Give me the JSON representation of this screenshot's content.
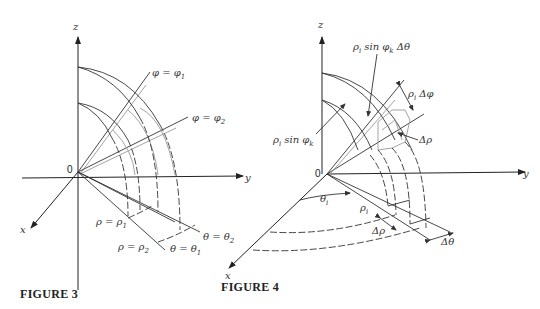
{
  "figure3": {
    "caption": "FIGURE 3",
    "axes": {
      "z": "z",
      "y": "y",
      "x": "x",
      "origin": "0"
    },
    "labels": {
      "phi1": {
        "main": "φ = φ",
        "sub": "1"
      },
      "phi2": {
        "main": "φ = φ",
        "sub": "2"
      },
      "rho1": {
        "main": "ρ = ρ",
        "sub": "1"
      },
      "rho2": {
        "main": "ρ = ρ",
        "sub": "2"
      },
      "theta1": {
        "main": "θ = θ",
        "sub": "1"
      },
      "theta2": {
        "main": "θ = θ",
        "sub": "2"
      }
    }
  },
  "figure4": {
    "caption": "FIGURE 4",
    "axes": {
      "z": "z",
      "y": "y",
      "x": "x",
      "origin": "0"
    },
    "labels": {
      "arc_length_theta": {
        "pre": "ρ",
        "sub1": "i",
        "mid": " sin φ",
        "sub2": "k",
        "post": "  Δθ"
      },
      "radius_sin": {
        "pre": "ρ",
        "sub1": "i",
        "mid": " sin φ",
        "sub2": "k"
      },
      "arc_length_phi": {
        "pre": "ρ",
        "sub1": "i",
        "post": " Δφ"
      },
      "delta_rho_top": "Δρ",
      "theta_i": {
        "main": "θ",
        "sub": "i"
      },
      "rho_i": {
        "main": "ρ",
        "sub": "i"
      },
      "delta_rho_bottom": "Δρ",
      "delta_theta": "Δθ"
    }
  }
}
